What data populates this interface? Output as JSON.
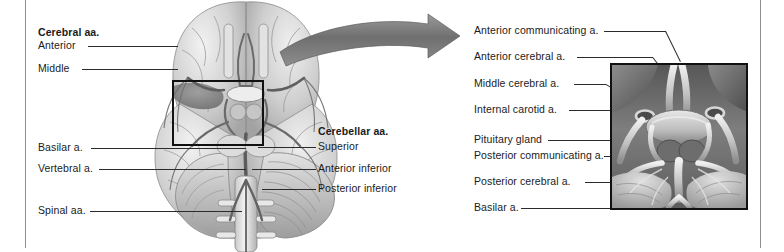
{
  "figure": {
    "title_visible": false,
    "background_color": "#ffffff",
    "ink_color": "#1b1b1b"
  },
  "left_panel": {
    "name": "inferior-view-of-brain-arteries",
    "view_description": "Inferior view of the brain showing arterial supply",
    "selection_box": {
      "label": "circle-of-willis-detail-region",
      "x": 172,
      "y": 86,
      "width": 72,
      "height": 64,
      "border_color": "#111111"
    },
    "label_groups": [
      {
        "name": "cerebral-arteries-group",
        "heading": "Cerebral aa.",
        "items": [
          "Anterior",
          "Middle"
        ]
      },
      {
        "name": "cerebellar-arteries-group",
        "heading": "Cerebellar aa.",
        "items": [
          "Superior",
          "Anterior inferior",
          "Posterior inferior"
        ]
      }
    ],
    "single_labels": [
      "Basilar a.",
      "Vertebral a.",
      "Spinal aa."
    ]
  },
  "arrow": {
    "name": "magnification-arrow",
    "direction": "right",
    "color": "#7a7a7a"
  },
  "right_panel": {
    "name": "circle-of-willis-detail",
    "inset_border_color": "#111111",
    "labels": [
      "Anterior communicating a.",
      "Anterior cerebral a.",
      "Middle cerebral a.",
      "Internal carotid a.",
      "Pituitary gland",
      "Posterior communicating a.",
      "Posterior cerebral a.",
      "Basilar a."
    ]
  }
}
